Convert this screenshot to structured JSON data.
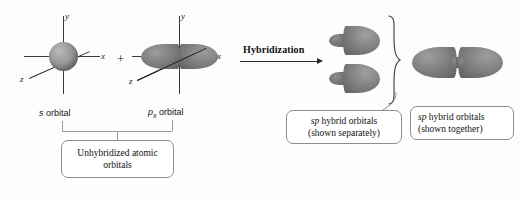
{
  "figure": {
    "type": "chemistry-orbital-hybridization-diagram",
    "title": "",
    "background_color": "#fdfdfd",
    "orbital_color": "#7e7e7e",
    "axis_color": "#3a3a3a",
    "box_border_color": "#8d8d8d"
  },
  "left_group": {
    "s_orbital": {
      "label_italic": "s",
      "label_rest": " orbital",
      "shape": "sphere",
      "axes": {
        "x": "x",
        "y": "y",
        "z": "z"
      }
    },
    "operator": "+",
    "p_orbital": {
      "label_italic": "p",
      "label_subscript": "x",
      "label_rest": " orbital",
      "shape": "two-lobed dumbbell along x",
      "axes": {
        "x": "x",
        "y": "y",
        "z": "z"
      }
    },
    "box_label_line1": "Unhybridized atomic",
    "box_label_line2": "orbitals"
  },
  "transition": {
    "label": "Hybridization",
    "arrow": "right-arrow"
  },
  "right_group": {
    "separate": {
      "count": 2,
      "box_line1_italic": "sp",
      "box_line1_rest": " hybrid orbitals",
      "box_line2": "(shown separately)",
      "brace": "right-curly-brace"
    },
    "together": {
      "count": 1,
      "box_line1_italic": "sp",
      "box_line1_rest": " hybrid orbitals",
      "box_line2": "(shown together)"
    }
  }
}
